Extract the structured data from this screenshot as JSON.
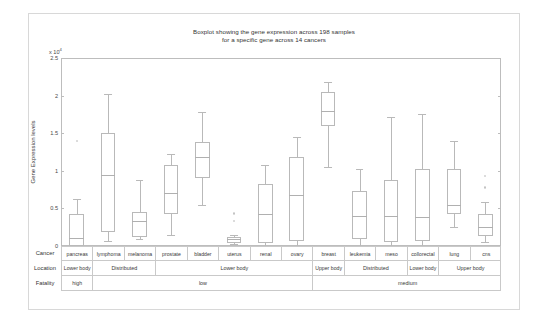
{
  "chart_data": {
    "type": "box",
    "title": "Boxplot showing the gene expression across 198 samples",
    "title_line2": "for a specific gene across 14 cancers",
    "ylabel": "Gene Expression levels",
    "xlabel": "",
    "y_multiplier": "x 10",
    "y_multiplier_exp": "4",
    "ylim": [
      0,
      2.5
    ],
    "yticks": [
      0,
      0.5,
      1,
      1.5,
      2,
      2.5
    ],
    "ytick_labels": [
      "0",
      "0.5",
      "1",
      "1.5",
      "2",
      "2.5"
    ],
    "grid": false,
    "legend": "none",
    "categories": [
      "pancreas",
      "lymphoma",
      "melanoma",
      "prostate",
      "bladder",
      "uterus",
      "renal",
      "ovary",
      "breast",
      "leukemia",
      "meso",
      "collorectal",
      "lung",
      "cns"
    ],
    "boxes": [
      {
        "name": "pancreas",
        "whisker_low": 0.0,
        "q1": 0.0,
        "median": 0.1,
        "q3": 0.42,
        "whisker_high": 0.63,
        "outliers": [
          1.4
        ]
      },
      {
        "name": "lymphoma",
        "whisker_low": 0.07,
        "q1": 0.18,
        "median": 0.95,
        "q3": 1.5,
        "whisker_high": 2.02,
        "outliers": []
      },
      {
        "name": "melanoma",
        "whisker_low": 0.09,
        "q1": 0.12,
        "median": 0.33,
        "q3": 0.45,
        "whisker_high": 0.88,
        "outliers": []
      },
      {
        "name": "prostate",
        "whisker_low": 0.14,
        "q1": 0.42,
        "median": 0.7,
        "q3": 1.08,
        "whisker_high": 1.23,
        "outliers": []
      },
      {
        "name": "bladder",
        "whisker_low": 0.55,
        "q1": 0.9,
        "median": 1.18,
        "q3": 1.38,
        "whisker_high": 1.78,
        "outliers": []
      },
      {
        "name": "uterus",
        "whisker_low": 0.02,
        "q1": 0.04,
        "median": 0.09,
        "q3": 0.12,
        "whisker_high": 0.14,
        "outliers": [
          0.43,
          0.33
        ]
      },
      {
        "name": "renal",
        "whisker_low": 0.0,
        "q1": 0.04,
        "median": 0.42,
        "q3": 0.82,
        "whisker_high": 1.08,
        "outliers": []
      },
      {
        "name": "ovary",
        "whisker_low": 0.0,
        "q1": 0.06,
        "median": 0.68,
        "q3": 1.18,
        "whisker_high": 1.45,
        "outliers": []
      },
      {
        "name": "breast",
        "whisker_low": 1.05,
        "q1": 1.6,
        "median": 1.8,
        "q3": 2.05,
        "whisker_high": 2.18,
        "outliers": []
      },
      {
        "name": "leukemia",
        "whisker_low": 0.0,
        "q1": 0.09,
        "median": 0.4,
        "q3": 0.73,
        "whisker_high": 1.02,
        "outliers": []
      },
      {
        "name": "meso",
        "whisker_low": 0.0,
        "q1": 0.05,
        "median": 0.4,
        "q3": 0.88,
        "whisker_high": 1.72,
        "outliers": []
      },
      {
        "name": "collorectal",
        "whisker_low": 0.0,
        "q1": 0.07,
        "median": 0.38,
        "q3": 1.02,
        "whisker_high": 1.75,
        "outliers": []
      },
      {
        "name": "lung",
        "whisker_low": 0.25,
        "q1": 0.42,
        "median": 0.55,
        "q3": 1.02,
        "whisker_high": 1.4,
        "outliers": []
      },
      {
        "name": "cns",
        "whisker_low": 0.05,
        "q1": 0.13,
        "median": 0.25,
        "q3": 0.43,
        "whisker_high": 0.58,
        "outliers": [
          0.93,
          0.78
        ]
      }
    ],
    "annotation_rows": [
      {
        "label": "Cancer",
        "cells": [
          {
            "text": "pancreas",
            "span": 1
          },
          {
            "text": "lymphoma",
            "span": 1
          },
          {
            "text": "melanoma",
            "span": 1
          },
          {
            "text": "prostate",
            "span": 1
          },
          {
            "text": "bladder",
            "span": 1
          },
          {
            "text": "uterus",
            "span": 1
          },
          {
            "text": "renal",
            "span": 1
          },
          {
            "text": "ovary",
            "span": 1
          },
          {
            "text": "breast",
            "span": 1
          },
          {
            "text": "leukemia",
            "span": 1
          },
          {
            "text": "meso",
            "span": 1
          },
          {
            "text": "collorectal",
            "span": 1
          },
          {
            "text": "lung",
            "span": 1
          },
          {
            "text": "cns",
            "span": 1
          }
        ]
      },
      {
        "label": "Location",
        "cells": [
          {
            "text": "Lower body",
            "span": 1
          },
          {
            "text": "Distributed",
            "span": 2
          },
          {
            "text": "Lower body",
            "span": 5
          },
          {
            "text": "Upper body",
            "span": 1
          },
          {
            "text": "Distributed",
            "span": 2
          },
          {
            "text": "Lower body",
            "span": 1
          },
          {
            "text": "Upper body",
            "span": 2
          }
        ]
      },
      {
        "label": "Fatality",
        "cells": [
          {
            "text": "high",
            "span": 1
          },
          {
            "text": "low",
            "span": 7
          },
          {
            "text": "medium",
            "span": 6
          }
        ]
      }
    ]
  }
}
